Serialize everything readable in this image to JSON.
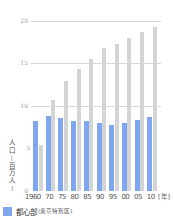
{
  "chart_data": {
    "type": "bar",
    "title": "",
    "xlabel": "[年]",
    "ylabel": "人口[百万人]",
    "ylim": [
      0,
      20
    ],
    "yticks": [
      0,
      5,
      10,
      15,
      20
    ],
    "grid": true,
    "categories": [
      "1960",
      "70",
      "75",
      "80",
      "85",
      "90",
      "95",
      "00",
      "05",
      "10"
    ],
    "series": [
      {
        "name": "都心部(東京特別区)",
        "color": "#7fa6ee",
        "values": [
          8.2,
          8.8,
          8.6,
          8.2,
          8.2,
          8.0,
          7.8,
          8.0,
          8.3,
          8.7
        ]
      },
      {
        "name": "",
        "color": "#d2d4d6",
        "values": [
          5.4,
          10.7,
          13.0,
          14.4,
          15.5,
          16.8,
          17.3,
          18.0,
          18.7,
          19.3
        ]
      }
    ],
    "legend_position": "bottom-left"
  },
  "axis": {
    "yticks": [
      "20",
      "15",
      "10",
      "5",
      "0"
    ],
    "ylabel_chars": [
      "人",
      "口",
      "[",
      "百",
      "万",
      "人",
      "]"
    ],
    "xunit": "[年]"
  },
  "legend": {
    "main": "都心部",
    "sub": "(東京特別区)"
  }
}
